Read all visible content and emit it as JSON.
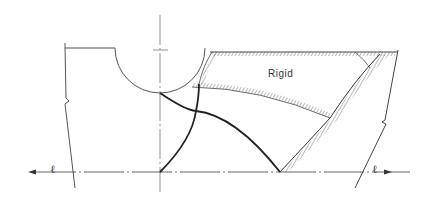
{
  "diagram": {
    "type": "slip-line field / plastic deformation zone",
    "labels": {
      "rigid_region": "Rigid",
      "centerline_left": "ℓ",
      "centerline_right": "ℓ"
    },
    "colors": {
      "line": "#444444",
      "heavy_line": "#222222",
      "background": "#ffffff"
    }
  }
}
